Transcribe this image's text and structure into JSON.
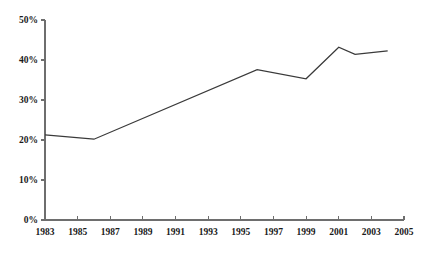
{
  "chart_data": {
    "type": "line",
    "title": "",
    "subtitle": "",
    "xlabel": "",
    "ylabel": "",
    "xlim": [
      1983,
      2005
    ],
    "ylim": [
      0,
      50
    ],
    "grid": false,
    "legend": null,
    "legend_position": "none",
    "x_tick_labels": [
      "1983",
      "1985",
      "1987",
      "1989",
      "1991",
      "1993",
      "1995",
      "1997",
      "1999",
      "2001",
      "2003",
      "2005"
    ],
    "x_ticks": [
      1983,
      1985,
      1987,
      1989,
      1991,
      1993,
      1995,
      1997,
      1999,
      2001,
      2003,
      2005
    ],
    "y_tick_labels": [
      "0%",
      "10%",
      "20%",
      "30%",
      "40%",
      "50%"
    ],
    "y_ticks": [
      0,
      10,
      20,
      30,
      40,
      50
    ],
    "series": [
      {
        "name": "",
        "color": "#3a3a3a",
        "x": [
          1983,
          1986,
          1996,
          1999,
          2001,
          2002,
          2004
        ],
        "values": [
          21.3,
          20.2,
          37.6,
          35.3,
          43.2,
          41.4,
          42.3
        ]
      }
    ]
  },
  "colors": {
    "line": "#3a3a3a",
    "axis": "#6e6e6e",
    "text": "#1a1a1a",
    "background": "#ffffff"
  }
}
